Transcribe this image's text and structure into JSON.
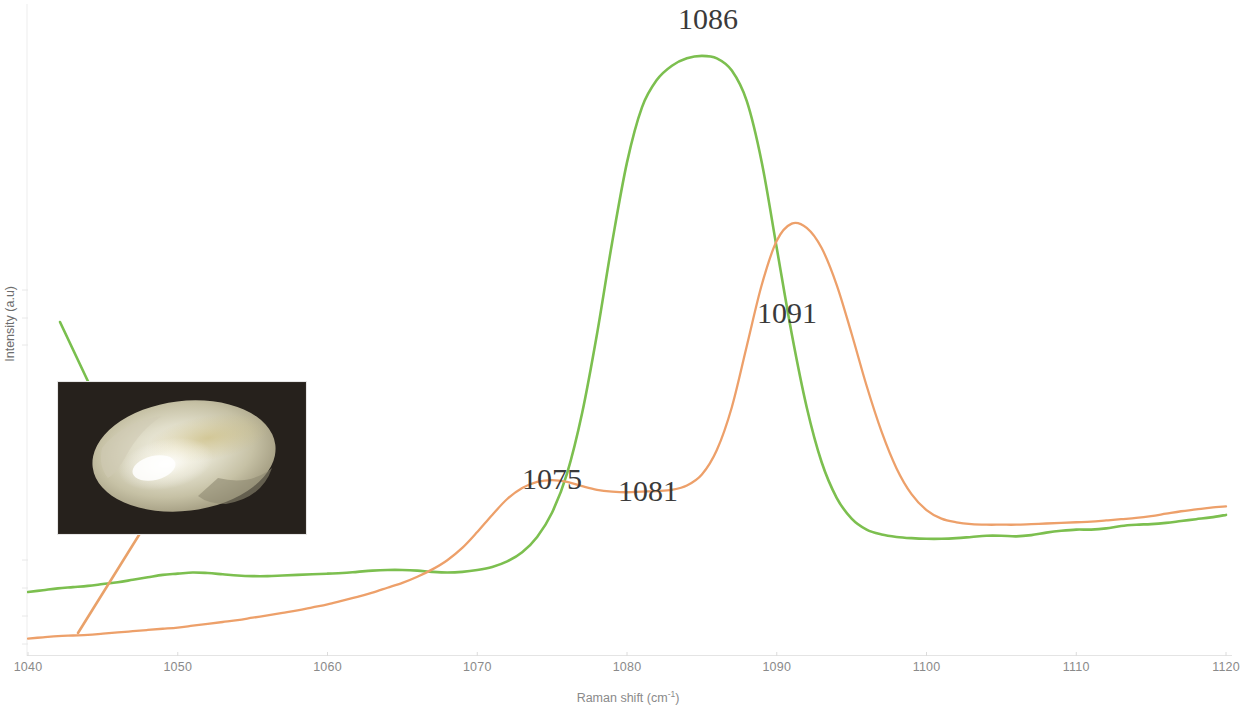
{
  "figure": {
    "background": "#ffffff",
    "width": 1248,
    "height": 714
  },
  "axes": {
    "x_title_text": "Raman shift (cm",
    "x_title_sup": "-1",
    "x_title_close": ")",
    "y_title": "Intensity (a.u)",
    "x_ticks": [
      "1040",
      "1050",
      "1060",
      "1070",
      "1080",
      "1090",
      "1100",
      "1110",
      "1120"
    ],
    "x_tick_color": "#8a8a8a",
    "axis_line_color": "#ededed"
  },
  "annotations": {
    "peak_labels": [
      {
        "text": "1086",
        "x": 708,
        "y": 2,
        "series": "green"
      },
      {
        "text": "1091",
        "x": 787,
        "y": 296,
        "series": "orange"
      },
      {
        "text": "1075",
        "x": 552,
        "y": 462,
        "series": "orange"
      },
      {
        "text": "1081",
        "x": 648,
        "y": 474,
        "series": "orange"
      }
    ],
    "arrows": [
      {
        "name": "green-arrow",
        "color": "#79bf4e",
        "from": {
          "x": 60,
          "y": 322
        },
        "to": {
          "x": 118,
          "y": 445
        },
        "points_to": "pearl rim"
      },
      {
        "name": "orange-arrow",
        "color": "#e9a169",
        "from": {
          "x": 78,
          "y": 633
        },
        "to": {
          "x": 172,
          "y": 482
        },
        "points_to": "pearl centre"
      }
    ]
  },
  "inset": {
    "name": "pearl-photograph",
    "caption": "",
    "background_color": "#2b2620",
    "pearl_colors": [
      "#d8d6c4",
      "#f2f0e4",
      "#b9b49a",
      "#cfc9a8",
      "#8f8a72"
    ]
  },
  "chart_data": {
    "type": "line",
    "title": "",
    "xlabel": "Raman shift (cm-1)",
    "ylabel": "Intensity (a.u)",
    "xlim": [
      1040,
      1120
    ],
    "ylim": [
      0,
      1
    ],
    "grid": false,
    "legend": "none",
    "series": [
      {
        "name": "green-spectrum",
        "color": "#7cbf4f",
        "offset_note": "upper trace",
        "peaks": [
          1086
        ],
        "x": [
          1040,
          1041,
          1042,
          1043,
          1044,
          1045,
          1046,
          1047,
          1048,
          1049,
          1050,
          1051,
          1052,
          1053,
          1054,
          1055,
          1056,
          1057,
          1058,
          1059,
          1060,
          1061,
          1062,
          1063,
          1064,
          1065,
          1066,
          1067,
          1068,
          1069,
          1070,
          1071,
          1072,
          1073,
          1074,
          1075,
          1076,
          1077,
          1078,
          1079,
          1080,
          1081,
          1082,
          1083,
          1084,
          1085,
          1086,
          1087,
          1088,
          1089,
          1090,
          1091,
          1092,
          1093,
          1094,
          1095,
          1096,
          1097,
          1098,
          1099,
          1100,
          1101,
          1102,
          1103,
          1104,
          1105,
          1106,
          1107,
          1108,
          1109,
          1110,
          1111,
          1112,
          1113,
          1114,
          1115,
          1116,
          1117,
          1118,
          1119,
          1120
        ],
        "y": [
          0.098,
          0.101,
          0.104,
          0.106,
          0.108,
          0.111,
          0.114,
          0.118,
          0.122,
          0.126,
          0.128,
          0.13,
          0.129,
          0.127,
          0.125,
          0.124,
          0.124,
          0.125,
          0.126,
          0.127,
          0.128,
          0.129,
          0.131,
          0.133,
          0.134,
          0.134,
          0.133,
          0.131,
          0.13,
          0.131,
          0.134,
          0.139,
          0.148,
          0.163,
          0.188,
          0.228,
          0.292,
          0.39,
          0.52,
          0.668,
          0.8,
          0.89,
          0.935,
          0.958,
          0.97,
          0.974,
          0.97,
          0.95,
          0.9,
          0.8,
          0.66,
          0.52,
          0.4,
          0.31,
          0.252,
          0.218,
          0.2,
          0.192,
          0.188,
          0.186,
          0.185,
          0.185,
          0.186,
          0.188,
          0.19,
          0.19,
          0.189,
          0.191,
          0.195,
          0.198,
          0.2,
          0.2,
          0.202,
          0.206,
          0.208,
          0.209,
          0.211,
          0.214,
          0.217,
          0.22,
          0.224
        ]
      },
      {
        "name": "orange-spectrum",
        "color": "#eda06a",
        "offset_note": "lower trace",
        "peaks": [
          1075,
          1081,
          1091
        ],
        "x": [
          1040,
          1041,
          1042,
          1043,
          1044,
          1045,
          1046,
          1047,
          1048,
          1049,
          1050,
          1051,
          1052,
          1053,
          1054,
          1055,
          1056,
          1057,
          1058,
          1059,
          1060,
          1061,
          1062,
          1063,
          1064,
          1065,
          1066,
          1067,
          1068,
          1069,
          1070,
          1071,
          1072,
          1073,
          1074,
          1075,
          1076,
          1077,
          1078,
          1079,
          1080,
          1081,
          1082,
          1083,
          1084,
          1085,
          1086,
          1087,
          1088,
          1089,
          1090,
          1091,
          1092,
          1093,
          1094,
          1095,
          1096,
          1097,
          1098,
          1099,
          1100,
          1101,
          1102,
          1103,
          1104,
          1105,
          1106,
          1107,
          1108,
          1109,
          1110,
          1111,
          1112,
          1113,
          1114,
          1115,
          1116,
          1117,
          1118,
          1119,
          1120
        ],
        "y": [
          0.022,
          0.024,
          0.026,
          0.027,
          0.028,
          0.03,
          0.032,
          0.034,
          0.036,
          0.038,
          0.04,
          0.043,
          0.046,
          0.049,
          0.052,
          0.056,
          0.06,
          0.064,
          0.068,
          0.073,
          0.078,
          0.084,
          0.09,
          0.097,
          0.105,
          0.113,
          0.123,
          0.135,
          0.15,
          0.17,
          0.196,
          0.224,
          0.25,
          0.268,
          0.278,
          0.281,
          0.278,
          0.271,
          0.265,
          0.262,
          0.261,
          0.262,
          0.263,
          0.265,
          0.272,
          0.29,
          0.33,
          0.4,
          0.5,
          0.6,
          0.672,
          0.7,
          0.693,
          0.66,
          0.6,
          0.52,
          0.435,
          0.36,
          0.3,
          0.258,
          0.232,
          0.218,
          0.212,
          0.209,
          0.208,
          0.208,
          0.208,
          0.209,
          0.21,
          0.211,
          0.212,
          0.213,
          0.215,
          0.217,
          0.219,
          0.222,
          0.226,
          0.23,
          0.233,
          0.236,
          0.238
        ]
      }
    ]
  }
}
